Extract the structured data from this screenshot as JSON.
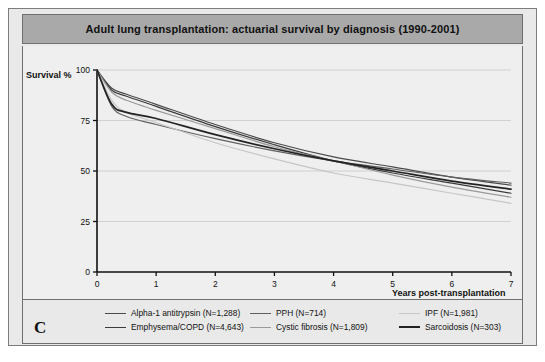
{
  "figure": {
    "panel_letter": "C",
    "title": "Adult lung transplantation: actuarial survival by diagnosis (1990-2001)"
  },
  "axes": {
    "ylabel": "Survival %",
    "xlabel": "Years post-transplantation",
    "yticks": [
      "0",
      "25",
      "50",
      "75",
      "100"
    ],
    "xticks": [
      "0",
      "1",
      "2",
      "3",
      "4",
      "5",
      "6",
      "7"
    ]
  },
  "colors": {
    "title_bar": "#a9a9a9",
    "panel_bg": "#e9e9e9",
    "plot_bg": "#efefef",
    "frame": "#6f6f6f",
    "dark_line": "#2b2b2b",
    "mid_line": "#6a6a6a",
    "light_line": "#c6c6c6"
  },
  "legend": {
    "columns": [
      {
        "items": [
          {
            "label": "Alpha-1 antitrypsin  (N=1,288)",
            "color": "#4a4a4a",
            "width": 1.6
          },
          {
            "label": "Emphysema/COPD  (N=4,643)",
            "color": "#3a3a3a",
            "width": 1.6
          }
        ]
      },
      {
        "items": [
          {
            "label": "PPH  (N=714)",
            "color": "#606060",
            "width": 1.6
          },
          {
            "label": "Cystic fibrosis  (N=1,809)",
            "color": "#9a9a9a",
            "width": 1.5
          }
        ]
      },
      {
        "items": [
          {
            "label": "IPF  (N=1,981)",
            "color": "#c6c6c6",
            "width": 1.4
          },
          {
            "label": "Sarcoidosis  (N=303)",
            "color": "#222222",
            "width": 2.1
          }
        ]
      }
    ]
  },
  "chart_data": {
    "type": "line",
    "title": "Adult lung transplantation: actuarial survival by diagnosis (1990-2001)",
    "xlabel": "Years post-transplantation",
    "ylabel": "Survival %",
    "xlim": [
      0,
      7
    ],
    "ylim": [
      0,
      100
    ],
    "xticks": [
      0,
      1,
      2,
      3,
      4,
      5,
      6,
      7
    ],
    "yticks": [
      0,
      25,
      50,
      75,
      100
    ],
    "grid": "horizontal",
    "legend_position": "below",
    "x": [
      0,
      0.25,
      0.5,
      1,
      2,
      3,
      4,
      5,
      6,
      7
    ],
    "series": [
      {
        "name": "Alpha-1 antitrypsin  (N=1,288)",
        "n": 1288,
        "color": "#4a4a4a",
        "values": [
          100,
          91,
          88,
          83,
          73,
          64,
          57,
          52,
          47,
          43
        ]
      },
      {
        "name": "Emphysema/COPD  (N=4,643)",
        "n": 4643,
        "color": "#3a3a3a",
        "values": [
          100,
          90,
          87,
          82,
          72,
          63,
          55,
          49,
          44,
          39
        ]
      },
      {
        "name": "PPH  (N=714)",
        "n": 714,
        "color": "#606060",
        "values": [
          100,
          82,
          77,
          73,
          66,
          60,
          55,
          51,
          47,
          44
        ]
      },
      {
        "name": "Cystic fibrosis  (N=1,809)",
        "n": 1809,
        "color": "#9a9a9a",
        "values": [
          100,
          89,
          85,
          80,
          71,
          62,
          55,
          48,
          42,
          37
        ]
      },
      {
        "name": "IPF  (N=1,981)",
        "n": 1981,
        "color": "#c6c6c6",
        "values": [
          100,
          85,
          79,
          74,
          64,
          56,
          49,
          44,
          39,
          34
        ]
      },
      {
        "name": "Sarcoidosis  (N=303)",
        "n": 303,
        "color": "#222222",
        "values": [
          100,
          83,
          79,
          76,
          68,
          61,
          55,
          50,
          45,
          41
        ]
      }
    ]
  }
}
